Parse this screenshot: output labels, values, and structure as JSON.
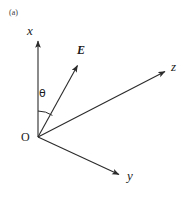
{
  "figure": {
    "panel_label": "(a)",
    "background_color": "#ffffff",
    "line_color": "#2b2b2b",
    "width": 195,
    "height": 201
  },
  "origin": {
    "label": "O",
    "x": 38,
    "y": 137
  },
  "axes": [
    {
      "name": "x-axis",
      "label": "x",
      "from": [
        38,
        137
      ],
      "to": [
        38,
        38
      ],
      "arrow": true
    },
    {
      "name": "z-axis",
      "label": "z",
      "from": [
        38,
        137
      ],
      "to": [
        168,
        70
      ],
      "arrow": true
    },
    {
      "name": "y-axis",
      "label": "y",
      "from": [
        38,
        137
      ],
      "to": [
        122,
        176
      ],
      "arrow": true
    }
  ],
  "vector": {
    "name": "E-field-vector",
    "label": "E",
    "from": [
      38,
      137
    ],
    "to": [
      80,
      62
    ],
    "arrow": true
  },
  "angle": {
    "name": "theta-angle",
    "label": "θ",
    "between": [
      "x-axis",
      "E-field-vector"
    ],
    "arc_radius": 26
  }
}
